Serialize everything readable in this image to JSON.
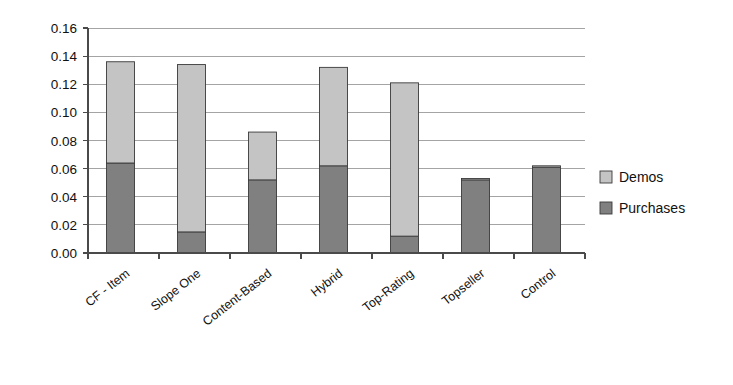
{
  "chart_data": {
    "type": "bar",
    "subtype": "stacked-bar",
    "title": "",
    "xlabel": "",
    "ylabel": "",
    "ylim": [
      0.0,
      0.16
    ],
    "ytick_step": 0.02,
    "ytick_labels": [
      "0.16",
      "0.14",
      "0.12",
      "0.10",
      "0.08",
      "0.06",
      "0.04",
      "0.02",
      "0.00"
    ],
    "ytick_values": [
      0.16,
      0.14,
      0.12,
      0.1,
      0.08,
      0.06,
      0.04,
      0.02,
      0.0
    ],
    "grid": true,
    "grid_axis": "y",
    "legend_position": "right",
    "categories": [
      "CF - Item",
      "Slope One",
      "Content-Based",
      "Hybrid",
      "Top-Rating",
      "Topseller",
      "Control"
    ],
    "series": [
      {
        "name": "Purchases",
        "color": "#808080",
        "values": [
          0.064,
          0.015,
          0.052,
          0.062,
          0.012,
          0.052,
          0.061
        ]
      },
      {
        "name": "Demos",
        "color": "#c4c4c4",
        "values": [
          0.072,
          0.119,
          0.034,
          0.07,
          0.109,
          0.001,
          0.001
        ]
      }
    ],
    "totals": [
      0.136,
      0.134,
      0.086,
      0.132,
      0.121,
      0.053,
      0.062
    ]
  },
  "legend": {
    "items": [
      {
        "label": "Demos",
        "color": "#c4c4c4"
      },
      {
        "label": "Purchases",
        "color": "#808080"
      }
    ]
  },
  "axis": {
    "y_min_label": "0.00",
    "y_max_label": "0.16"
  }
}
